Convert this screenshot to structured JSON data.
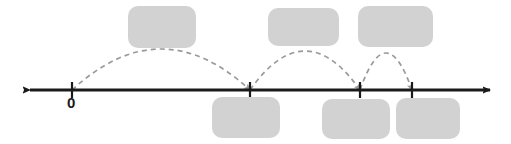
{
  "figure": {
    "type": "number-line-hop-diagram",
    "width": 511,
    "height": 144,
    "background_color": "#ffffff"
  },
  "colors": {
    "axis": "#1a1a1a",
    "tick": "#1a1a1a",
    "arc": "#9a9a9a",
    "redaction": "#d2d2d2",
    "label_text": "#1a1a1a"
  },
  "number_line": {
    "name": "number-line",
    "y": 90,
    "x_start": 30,
    "x_end": 490,
    "stroke_width": 3,
    "left_arrow": true,
    "right_arrow": true,
    "ticks": [
      {
        "id": "tick-zero",
        "x": 72,
        "label": "0",
        "label_visible": true,
        "label_x": 67,
        "label_y": 95
      },
      {
        "id": "tick-1",
        "x": 250,
        "label": "",
        "label_visible": false
      },
      {
        "id": "tick-2",
        "x": 360,
        "label": "",
        "label_visible": false
      },
      {
        "id": "tick-3",
        "x": 412,
        "label": "",
        "label_visible": false
      }
    ],
    "tick_half_height": 8
  },
  "arcs": [
    {
      "id": "hop-arc-1",
      "from_x": 72,
      "to_x": 250,
      "peak_y": 49,
      "baseline_y": 90,
      "dashed": true,
      "arrowhead_at": "end"
    },
    {
      "id": "hop-arc-2",
      "from_x": 250,
      "to_x": 360,
      "peak_y": 51,
      "baseline_y": 90,
      "dashed": true,
      "arrowhead_at": "end"
    },
    {
      "id": "hop-arc-3",
      "from_x": 360,
      "to_x": 412,
      "peak_y": 53,
      "baseline_y": 90,
      "dashed": true,
      "arrowhead_at": "end"
    }
  ],
  "redaction_boxes": {
    "above_line": [
      {
        "id": "redacted-label-top-1",
        "x": 128,
        "y": 6,
        "width": 68,
        "height": 42
      },
      {
        "id": "redacted-label-top-2",
        "x": 268,
        "y": 8,
        "width": 71,
        "height": 38
      },
      {
        "id": "redacted-label-top-3",
        "x": 358,
        "y": 6,
        "width": 75,
        "height": 41
      }
    ],
    "below_line": [
      {
        "id": "redacted-label-bottom-1",
        "x": 212,
        "y": 97,
        "width": 68,
        "height": 41
      },
      {
        "id": "redacted-label-bottom-2",
        "x": 322,
        "y": 99,
        "width": 68,
        "height": 40
      },
      {
        "id": "redacted-label-bottom-3",
        "x": 396,
        "y": 98,
        "width": 64,
        "height": 41
      }
    ]
  },
  "labels": {
    "zero": "0"
  }
}
